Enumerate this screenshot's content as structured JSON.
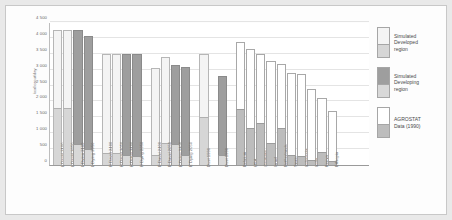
{
  "chart_data": {
    "type": "bar",
    "title": "",
    "xlabel": "",
    "ylabel": "kcal/caput/day",
    "ylim": [
      0,
      4500
    ],
    "yticks": [
      "0",
      "500",
      "1 000",
      "1 500",
      "2 000",
      "2 500",
      "3 000",
      "3 500",
      "4 000",
      "4 500"
    ],
    "ytick_values": [
      0,
      500,
      1000,
      1500,
      2000,
      2500,
      3000,
      3500,
      4000,
      4500
    ],
    "grid": true,
    "legend_position": "right",
    "stacked": true,
    "series": [
      {
        "name": "Simulated Developed region",
        "style": "light"
      },
      {
        "name": "Simulated Developing region",
        "style": "dark"
      },
      {
        "name": "AGROSTAT Data (1990)",
        "style": "white-gray"
      }
    ],
    "bars": [
      {
        "label": "L David 2100",
        "style": "light",
        "bottom": 1800,
        "total": 4250
      },
      {
        "label": "L David 2050",
        "style": "light",
        "bottom": 1780,
        "total": 4250
      },
      {
        "label": "L Dying 2100",
        "style": "dark",
        "bottom": 650,
        "total": 4260
      },
      {
        "label": "L Dying 2050",
        "style": "dark",
        "bottom": 500,
        "total": 4060
      },
      {
        "label": "H David 2100",
        "style": "light",
        "bottom": 370,
        "total": 3490
      },
      {
        "label": "H David 2050",
        "style": "light",
        "bottom": 370,
        "total": 3490
      },
      {
        "label": "H Dying 2100",
        "style": "dark",
        "bottom": 330,
        "total": 3490
      },
      {
        "label": "H Dying 2050",
        "style": "dark",
        "bottom": 280,
        "total": 3480
      },
      {
        "label": "E David 2100",
        "style": "light",
        "bottom": 300,
        "total": 3050
      },
      {
        "label": "E David 2050",
        "style": "light",
        "bottom": 680,
        "total": 3400
      },
      {
        "label": "E Dying 2100",
        "style": "dark",
        "bottom": 660,
        "total": 3160
      },
      {
        "label": "E Dying 2050",
        "style": "dark",
        "bottom": 300,
        "total": 3080
      },
      {
        "label": "Dust 1990",
        "style": "light",
        "bottom": 1500,
        "total": 3500
      },
      {
        "label": "Dust 1990",
        "style": "dark",
        "bottom": 300,
        "total": 2800
      },
      {
        "label": "Belgium",
        "style": "white-gray",
        "bottom": 1750,
        "total": 3870
      },
      {
        "label": "USA",
        "style": "white-gray",
        "bottom": 1180,
        "total": 3650
      },
      {
        "label": "Germany",
        "style": "white-gray",
        "bottom": 1330,
        "total": 3480
      },
      {
        "label": "Israel",
        "style": "white-gray",
        "bottom": 700,
        "total": 3260
      },
      {
        "label": "Netherlands",
        "style": "white-gray",
        "bottom": 1150,
        "total": 3180
      },
      {
        "label": "Spain",
        "style": "white-gray",
        "bottom": 300,
        "total": 2900
      },
      {
        "label": "Indonesia",
        "style": "white-gray",
        "bottom": 280,
        "total": 2880
      },
      {
        "label": "India",
        "style": "white-gray",
        "bottom": 150,
        "total": 2400
      },
      {
        "label": "Kenya",
        "style": "white-gray",
        "bottom": 420,
        "total": 2100
      },
      {
        "label": "Ethiopia",
        "style": "white-gray",
        "bottom": 130,
        "total": 1700
      }
    ],
    "groups": [
      {
        "start": 0,
        "count": 4
      },
      {
        "start": 4,
        "count": 4
      },
      {
        "start": 8,
        "count": 4
      },
      {
        "start": 12,
        "count": 1
      },
      {
        "start": 13,
        "count": 1
      },
      {
        "start": 14,
        "count": 10
      }
    ]
  },
  "legend": {
    "items": [
      {
        "label": "Simulated\nDeveloped\nregion",
        "line1": "Simulated",
        "line2": "Developed",
        "line3": "region",
        "top_color": "#f4f4f4",
        "bottom_color": "#d6d6d6"
      },
      {
        "label": "Simulated\nDeveloping\nregion",
        "line1": "Simulated",
        "line2": "Developing",
        "line3": "region",
        "top_color": "#9e9e9e",
        "bottom_color": "#d8d8d8"
      },
      {
        "label": "AGROSTAT\nData (1990)",
        "line1": "AGROSTAT",
        "line2": "Data (1990)",
        "line3": "",
        "top_color": "#ffffff",
        "bottom_color": "#bdbdbd"
      }
    ]
  },
  "colors": {
    "page_background": "#e9e9e9",
    "panel_background": "#fdfdfd",
    "plot_background": "#ffffff",
    "gridline": "#e4e4e4",
    "axis": "#9a9a9a",
    "light_top": "#f4f4f4",
    "light_bottom": "#d6d6d6",
    "dark_top": "#9e9e9e",
    "dark_bottom": "#d8d8d8",
    "white_top": "#ffffff",
    "gray_bottom": "#bdbdbd",
    "text": "#4a4a4a"
  }
}
